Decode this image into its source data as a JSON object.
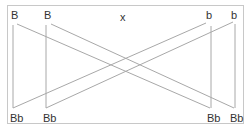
{
  "diagram": {
    "type": "genetic-cross",
    "cross_symbol": "x",
    "parents": {
      "parent1": [
        "B",
        "B"
      ],
      "parent2": [
        "b",
        "b"
      ]
    },
    "offspring": [
      "Bb",
      "Bb",
      "Bb",
      "Bb"
    ],
    "colors": {
      "line": "#a8a8a8",
      "border": "#c8c8c8",
      "text": "#333333"
    }
  }
}
